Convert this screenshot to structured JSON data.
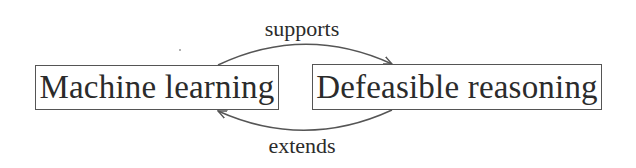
{
  "diagram": {
    "nodes": [
      {
        "id": "machine-learning",
        "label": "Machine learning"
      },
      {
        "id": "defeasible-reasoning",
        "label": "Defeasible reasoning"
      }
    ],
    "edges": [
      {
        "from": "machine-learning",
        "to": "defeasible-reasoning",
        "label": "supports",
        "position": "top"
      },
      {
        "from": "defeasible-reasoning",
        "to": "machine-learning",
        "label": "extends",
        "position": "bottom"
      }
    ],
    "colors": {
      "stroke": "#555555",
      "text": "#2b2b2b",
      "background": "#ffffff"
    }
  }
}
